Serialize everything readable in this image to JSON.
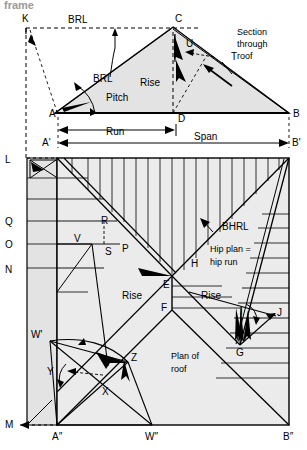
{
  "figure": {
    "cut_off_heading": "frame",
    "section_caption_line1": "Section",
    "section_caption_line2": "through",
    "section_caption_line3": "roof",
    "plan_caption_line1": "Plan of",
    "plan_caption_line2": "roof",
    "colors": {
      "line": "#000000",
      "fill": "#e3e3e3",
      "fill_light": "#ebebeb",
      "dashed": "#000000",
      "cut_text": "#9a9a9a"
    }
  },
  "section": {
    "labels": {
      "brl_top": "BRL",
      "brl_leader": "BRL",
      "rise": "Rise",
      "pitch": "Pitch",
      "run": "Run",
      "span": "Span"
    },
    "points": [
      {
        "id": "K",
        "text": "K",
        "x": 22,
        "y": 22
      },
      {
        "id": "C",
        "text": "C",
        "x": 175,
        "y": 22
      },
      {
        "id": "U",
        "text": "U",
        "x": 186,
        "y": 47
      },
      {
        "id": "T",
        "text": "T",
        "x": 231,
        "y": 60
      },
      {
        "id": "A",
        "text": "A",
        "x": 54,
        "y": 117
      },
      {
        "id": "D",
        "text": "D",
        "x": 178,
        "y": 119
      },
      {
        "id": "B",
        "text": "B",
        "x": 291,
        "y": 117
      },
      {
        "id": "Ap",
        "text": "A'",
        "x": 47,
        "y": 137
      },
      {
        "id": "Bp",
        "text": "B'",
        "x": 292,
        "y": 137
      }
    ]
  },
  "plan": {
    "labels": {
      "rise_left": "Rise",
      "rise_right": "Rise",
      "bhrl": "BHRL",
      "hip_plan_line1": "Hip plan =",
      "hip_plan_line2": "hip run"
    },
    "points": [
      {
        "id": "L",
        "text": "L",
        "x": 8,
        "y": 159
      },
      {
        "id": "Q",
        "text": "Q",
        "x": 8,
        "y": 221
      },
      {
        "id": "O",
        "text": "O",
        "x": 8,
        "y": 244
      },
      {
        "id": "N",
        "text": "N",
        "x": 8,
        "y": 270
      },
      {
        "id": "M",
        "text": "M",
        "x": 8,
        "y": 424
      },
      {
        "id": "R",
        "text": "R",
        "x": 105,
        "y": 224
      },
      {
        "id": "V",
        "text": "V",
        "x": 77,
        "y": 240
      },
      {
        "id": "S",
        "text": "S",
        "x": 107,
        "y": 251
      },
      {
        "id": "P",
        "text": "P",
        "x": 124,
        "y": 248
      },
      {
        "id": "E",
        "text": "E",
        "x": 164,
        "y": 278
      },
      {
        "id": "H",
        "text": "H",
        "x": 194,
        "y": 260
      },
      {
        "id": "F",
        "text": "F",
        "x": 163,
        "y": 311
      },
      {
        "id": "G",
        "text": "G",
        "x": 240,
        "y": 340
      },
      {
        "id": "I",
        "text": "I",
        "x": 242,
        "y": 312
      },
      {
        "id": "J",
        "text": "J",
        "x": 276,
        "y": 311
      },
      {
        "id": "Wp",
        "text": "W'",
        "x": 35,
        "y": 338
      },
      {
        "id": "Z",
        "text": "Z",
        "x": 131,
        "y": 359
      },
      {
        "id": "Y",
        "text": "Y",
        "x": 56,
        "y": 372
      },
      {
        "id": "X",
        "text": "X",
        "x": 105,
        "y": 390
      },
      {
        "id": "App",
        "text": "A″",
        "x": 58,
        "y": 438
      },
      {
        "id": "Wpp",
        "text": "W″",
        "x": 153,
        "y": 438
      },
      {
        "id": "Bpp",
        "text": "B″",
        "x": 288,
        "y": 438
      }
    ]
  }
}
